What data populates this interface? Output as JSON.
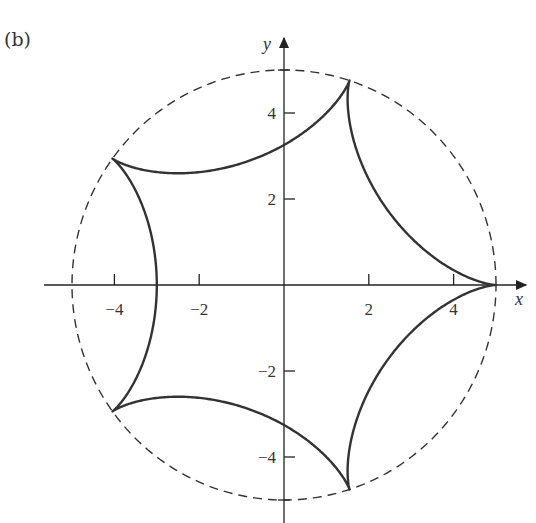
{
  "panel_label": "(b)",
  "chart_data": {
    "type": "line",
    "title": "",
    "panel": "(b)",
    "xlabel": "x",
    "ylabel": "y",
    "xlim": [
      -5.2,
      5.6
    ],
    "ylim": [
      -5.5,
      5.6
    ],
    "x_ticks": [
      -4,
      -2,
      2,
      4
    ],
    "x_tick_labels": [
      "−4",
      "−2",
      "2",
      "4"
    ],
    "y_ticks": [
      4,
      2,
      -2,
      -4
    ],
    "y_tick_labels": [
      "4",
      "2",
      "−2",
      "−4"
    ],
    "grid": false,
    "legend": null,
    "series": [
      {
        "name": "hypocycloid (5 cusps)",
        "style": "solid",
        "parametric": "x = 4cos t + cos 4t, y = 4sin t − sin 4t",
        "cusps": [
          [
            5,
            0
          ],
          [
            1.55,
            4.76
          ],
          [
            -4.05,
            2.94
          ],
          [
            -4.05,
            -2.94
          ],
          [
            1.55,
            -4.76
          ]
        ]
      },
      {
        "name": "circle radius 5",
        "style": "dashed",
        "center": [
          0,
          0
        ],
        "radius": 5
      }
    ]
  }
}
